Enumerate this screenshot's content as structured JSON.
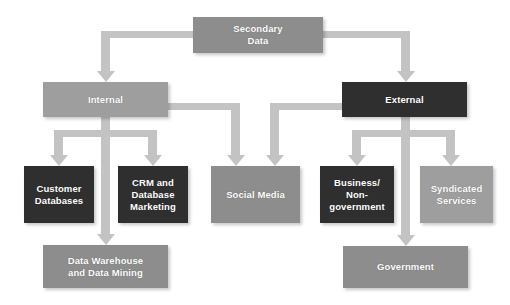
{
  "diagram": {
    "title_text": "Secondary Data",
    "background_color": "#ffffff",
    "connector_color": "#c3c3c3",
    "palette": {
      "mid_gray": "#8d8d8d",
      "light_gray": "#9e9e9e",
      "dark": "#2f2f2f",
      "label_color": "#ffffff"
    },
    "nodes": {
      "root": {
        "label": "Secondary\nData",
        "shade": "mid_gray"
      },
      "internal": {
        "label": "Internal",
        "shade": "light_gray"
      },
      "external": {
        "label": "External",
        "shade": "dark"
      },
      "customer_databases": {
        "label": "Customer\nDatabases",
        "shade": "dark"
      },
      "crm_database_marketing": {
        "label": "CRM and\nDatabase\nMarketing",
        "shade": "dark"
      },
      "social_media": {
        "label": "Social Media",
        "shade": "mid_gray"
      },
      "business_nongovernment": {
        "label": "Business/\nNon-\ngovernment",
        "shade": "dark"
      },
      "syndicated_services": {
        "label": "Syndicated\nServices",
        "shade": "light_gray"
      },
      "data_warehouse": {
        "label": "Data Warehouse\nand Data Mining",
        "shade": "mid_gray"
      },
      "government": {
        "label": "Government",
        "shade": "mid_gray"
      }
    },
    "edges": [
      {
        "from": "root",
        "to": "internal"
      },
      {
        "from": "root",
        "to": "external"
      },
      {
        "from": "internal",
        "to": "customer_databases"
      },
      {
        "from": "internal",
        "to": "crm_database_marketing"
      },
      {
        "from": "internal",
        "to": "data_warehouse"
      },
      {
        "from": "internal",
        "to": "social_media"
      },
      {
        "from": "external",
        "to": "social_media"
      },
      {
        "from": "external",
        "to": "business_nongovernment"
      },
      {
        "from": "external",
        "to": "syndicated_services"
      },
      {
        "from": "external",
        "to": "government"
      }
    ]
  }
}
